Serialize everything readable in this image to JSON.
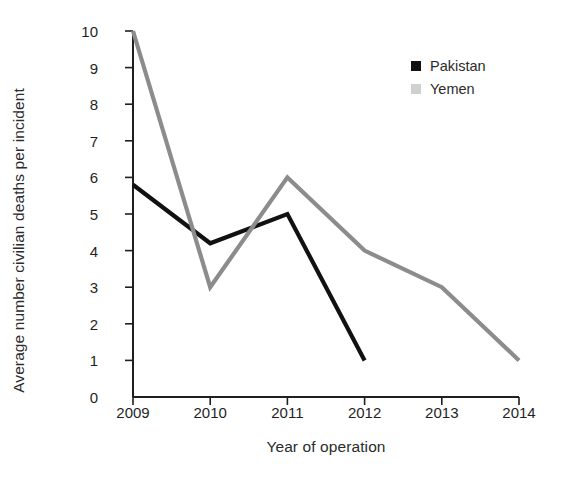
{
  "chart_data": {
    "type": "line",
    "title": "",
    "xlabel": "Year of operation",
    "ylabel": "Average number civilian deaths per incident",
    "x": [
      2009,
      2010,
      2011,
      2012,
      2013,
      2014
    ],
    "x_tick_labels": [
      "2009",
      "2010",
      "2011",
      "2012",
      "2013",
      "2014"
    ],
    "y_tick_labels": [
      "0",
      "1",
      "2",
      "3",
      "4",
      "5",
      "6",
      "7",
      "8",
      "9",
      "10"
    ],
    "y_ticks": [
      0,
      1,
      2,
      3,
      4,
      5,
      6,
      7,
      8,
      9,
      10
    ],
    "ylim": [
      0,
      10
    ],
    "xlim": [
      2009,
      2014
    ],
    "grid": false,
    "legend_position": "top-right",
    "series": [
      {
        "name": "Pakistan",
        "color": "#111111",
        "marker": "filled-square",
        "x": [
          2009,
          2010,
          2011,
          2012
        ],
        "values": [
          5.8,
          4.2,
          5.0,
          1.0
        ]
      },
      {
        "name": "Yemen",
        "color": "#8c8c8c",
        "marker": "filled-square",
        "x": [
          2009,
          2010,
          2011,
          2012,
          2013,
          2014
        ],
        "values": [
          10.0,
          3.0,
          6.0,
          4.0,
          3.0,
          1.0
        ]
      }
    ]
  },
  "legend": {
    "items": [
      {
        "label": "Pakistan",
        "color": "#111111"
      },
      {
        "label": "Yemen",
        "color": "#d0d0d0"
      }
    ]
  },
  "axes": {
    "x_title": "Year of operation",
    "y_title": "Average number civilian deaths per incident"
  }
}
